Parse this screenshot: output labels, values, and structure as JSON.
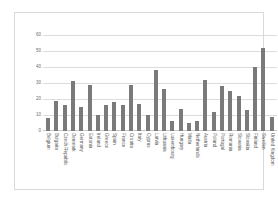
{
  "chart_data": {
    "type": "bar",
    "title": "",
    "subtitle": "",
    "xlabel": "",
    "ylabel": "",
    "ylim": [
      0,
      60
    ],
    "yticks": [
      0,
      10,
      20,
      30,
      40,
      50,
      60
    ],
    "grid": true,
    "legend": false,
    "legend_position": "none",
    "bar_color": "#7a7a7a",
    "grid_color": "#dcdcdc",
    "categories": [
      "Belgium",
      "Bulgaria",
      "Czech Republic",
      "Denmark",
      "Germany",
      "Estonia",
      "Ireland",
      "Greece",
      "Spain",
      "France",
      "Croatia",
      "Italy",
      "Cyprus",
      "Latvia",
      "Lithuania",
      "Luxembourg",
      "Hungary",
      "Malta",
      "Netherlands",
      "Austria",
      "Poland",
      "Portugal",
      "Romania",
      "Slovenia",
      "Slovakia",
      "Finland",
      "Sweden",
      "United Kingdom"
    ],
    "values": [
      8,
      19,
      16,
      31,
      15,
      29,
      10,
      16,
      18,
      16,
      29,
      17,
      10,
      38,
      26,
      6,
      14,
      5,
      6,
      32,
      12,
      28,
      25,
      22,
      13,
      40,
      52,
      9
    ]
  }
}
